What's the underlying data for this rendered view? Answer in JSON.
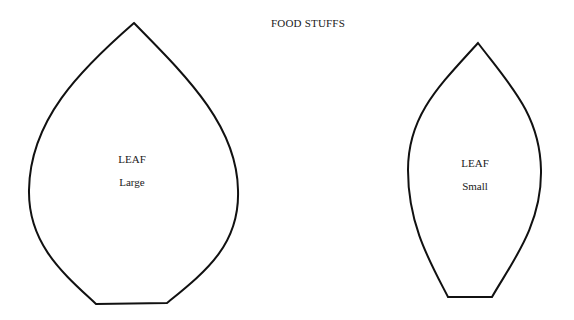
{
  "title": "FOOD STUFFS",
  "shapes": [
    {
      "id": "leaf-large",
      "name": "LEAF",
      "size": "Large",
      "stroke": "#111111",
      "fill": "#ffffff"
    },
    {
      "id": "leaf-small",
      "name": "LEAF",
      "size": "Small",
      "stroke": "#111111",
      "fill": "#ffffff"
    }
  ]
}
